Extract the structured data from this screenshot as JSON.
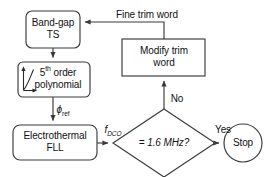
{
  "diagram": {
    "stroke_color": "#3a3a3a",
    "text_color": "#111111",
    "background_color": "#ffffff",
    "nodes": {
      "bandgap": {
        "line1": "Band-gap",
        "line2": "TS",
        "shape": "rounded-rectangle"
      },
      "polynomial": {
        "line1": "5",
        "line1_sup": "th",
        "line1_rest": " order",
        "line2": "polynomial",
        "shape": "rounded-rectangle",
        "icon": "curve-axes-icon"
      },
      "fll": {
        "line1": "Electrothermal",
        "line2": "FLL",
        "shape": "rounded-rectangle"
      },
      "modify": {
        "line1": "Modify trim",
        "line2": "word",
        "shape": "rectangle"
      },
      "decision": {
        "text": "= 1.6 MHz?",
        "shape": "diamond"
      },
      "stop": {
        "text": "Stop",
        "shape": "circle"
      }
    },
    "edge_labels": {
      "fine_trim_word": "Fine trim word",
      "phi_ref_symbol": "ϕ",
      "phi_ref_sub": "ref",
      "f_dco_symbol": "f",
      "f_dco_sub": "DCO",
      "no": "No",
      "yes": "Yes"
    }
  }
}
